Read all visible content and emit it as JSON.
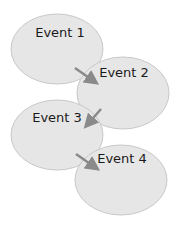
{
  "diagram": {
    "type": "flow",
    "colors": {
      "fill": "#e6e6e6",
      "stroke": "#c8c8c8",
      "arrow": "#8a8a8a",
      "text": "#1a1a1a"
    },
    "nodes": [
      {
        "id": "e1",
        "label": "Event 1"
      },
      {
        "id": "e2",
        "label": "Event 2"
      },
      {
        "id": "e3",
        "label": "Event 3"
      },
      {
        "id": "e4",
        "label": "Event 4"
      }
    ],
    "edges": [
      {
        "from": "e1",
        "to": "e2"
      },
      {
        "from": "e2",
        "to": "e3"
      },
      {
        "from": "e3",
        "to": "e4"
      }
    ]
  }
}
